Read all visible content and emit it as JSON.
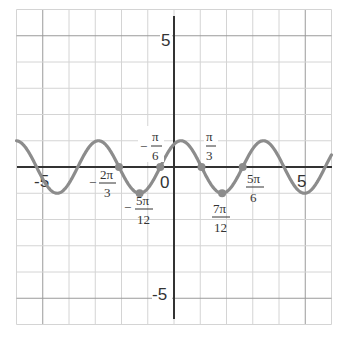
{
  "chart_data": {
    "type": "line",
    "title": "",
    "function": "y = sin(2x + π/3)",
    "xlabel": "",
    "ylabel": "",
    "xlim": [
      -6,
      6
    ],
    "ylim": [
      -6,
      6
    ],
    "grid": true,
    "grid_step": 1,
    "x_tick_labels": [
      {
        "x": -5,
        "label": "-5"
      },
      {
        "x": 0,
        "label": "0"
      },
      {
        "x": 5,
        "label": "5"
      }
    ],
    "y_tick_labels": [
      {
        "y": 5,
        "label": "5"
      },
      {
        "y": -5,
        "label": "-5"
      }
    ],
    "series": [
      {
        "name": "sin(2x + π/3)",
        "color": "#8c8c8c",
        "amplitude": 1,
        "period": "π",
        "phase_shift": "-π/6"
      }
    ],
    "marked_points": [
      {
        "x": -2.0944,
        "y": 0,
        "label_num": "2π",
        "label_den": "3",
        "negative": true
      },
      {
        "x": -1.309,
        "y": -1,
        "label_num": "5π",
        "label_den": "12",
        "negative": true
      },
      {
        "x": -0.5236,
        "y": 0,
        "label_num": "π",
        "label_den": "6",
        "negative": true
      },
      {
        "x": 1.0472,
        "y": 0,
        "label_num": "π",
        "label_den": "3",
        "negative": false
      },
      {
        "x": 1.8326,
        "y": -1,
        "label_num": "7π",
        "label_den": "12",
        "negative": false
      },
      {
        "x": 2.618,
        "y": 0,
        "label_num": "5π",
        "label_den": "6",
        "negative": false
      }
    ]
  },
  "labels": {
    "y5": "5",
    "yneg5": "-5",
    "xneg5": "-5",
    "x0": "0",
    "x5": "5",
    "minus": "−",
    "p1_num": "2π",
    "p1_den": "3",
    "p2_num": "5π",
    "p2_den": "12",
    "p3_num": "π",
    "p3_den": "6",
    "p4_num": "π",
    "p4_den": "3",
    "p5_num": "7π",
    "p5_den": "12",
    "p6_num": "5π",
    "p6_den": "6"
  }
}
